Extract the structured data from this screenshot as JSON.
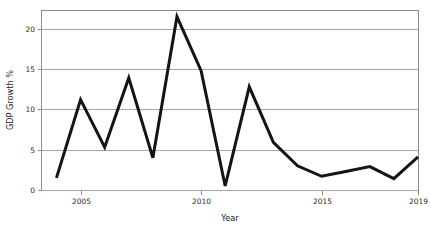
{
  "chart_data": {
    "type": "line",
    "title": "",
    "subtitle": "",
    "xlabel": "Year",
    "ylabel": "GDP Growth %",
    "x": [
      2004,
      2005,
      2006,
      2007,
      2008,
      2009,
      2010,
      2011,
      2012,
      2013,
      2014,
      2015,
      2016,
      2017,
      2018,
      2019
    ],
    "values": [
      1.5,
      11.2,
      5.3,
      13.9,
      4.0,
      21.5,
      14.8,
      0.5,
      12.8,
      5.9,
      3.0,
      1.7,
      2.3,
      2.9,
      1.4,
      4.1
    ],
    "series": [
      {
        "name": "GDP Growth %",
        "color": "#141414",
        "values": [
          1.5,
          11.2,
          5.3,
          13.9,
          4.0,
          21.5,
          14.8,
          0.5,
          12.8,
          5.9,
          3.0,
          1.7,
          2.3,
          2.9,
          1.4,
          4.1
        ]
      }
    ],
    "xlim": [
      2003.4,
      2019.0
    ],
    "ylim": [
      0,
      22.2
    ],
    "x_ticks": [
      2005,
      2010,
      2015,
      2019
    ],
    "x_tick_labels": [
      "2005",
      "2010",
      "2015",
      "2019"
    ],
    "y_ticks": [
      0,
      5,
      10,
      15,
      20
    ],
    "y_tick_labels": [
      "0",
      "5",
      "10",
      "15",
      "20"
    ],
    "grid": true,
    "grid_axis": "y",
    "grid_color": "#a6a6a6",
    "frame_color": "#8c8c8c",
    "legend": false,
    "legend_position": "none",
    "background": "#ffffff",
    "line_width": 3
  },
  "axes": {
    "x_title": "Year",
    "y_title": "GDP Growth %"
  },
  "ticks": {
    "y": [
      "0",
      "5",
      "10",
      "15",
      "20"
    ],
    "x": [
      "2005",
      "2010",
      "2015",
      "2019"
    ]
  },
  "colors": {
    "line": "#141414",
    "grid": "#a6a6a6",
    "frame": "#8c8c8c",
    "text": "#1a1a1a",
    "background": "#ffffff"
  }
}
